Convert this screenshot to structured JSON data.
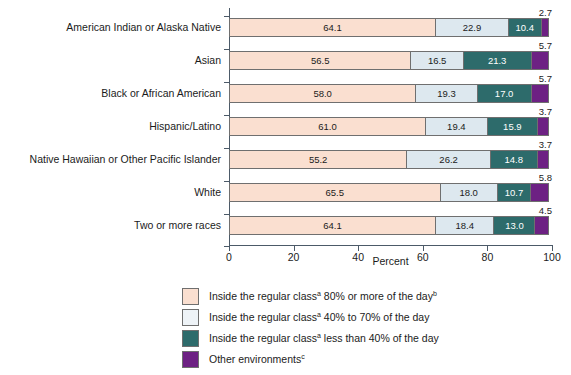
{
  "chart_data": {
    "type": "bar",
    "subtype": "horizontal-stacked",
    "title": "",
    "xlabel": "Percent",
    "ylabel": "",
    "xlim": [
      0,
      100
    ],
    "xticks": [
      0,
      20,
      40,
      60,
      80,
      100
    ],
    "grid": false,
    "legend_position": "bottom",
    "categories": [
      "American Indian or Alaska Native",
      "Asian",
      "Black or African American",
      "Hispanic/Latino",
      "Native Hawaiian or Other Pacific Islander",
      "White",
      "Two or more races"
    ],
    "series": [
      {
        "name": "Inside the regular class 80% or more of the day",
        "color": "#fadfd0",
        "values": [
          64.1,
          56.5,
          58.0,
          61.0,
          55.2,
          65.5,
          64.1
        ]
      },
      {
        "name": "Inside the regular class 40% to 70% of the day",
        "color": "#dde8ef",
        "values": [
          22.9,
          16.5,
          19.3,
          19.4,
          26.2,
          18.0,
          18.4
        ]
      },
      {
        "name": "Inside the regular class less than 40% of the day",
        "color": "#2d6b6b",
        "values": [
          10.4,
          21.3,
          17.0,
          15.9,
          14.8,
          10.7,
          13.0
        ]
      },
      {
        "name": "Other environments",
        "color": "#6d2183",
        "values": [
          2.7,
          5.7,
          5.7,
          3.7,
          3.7,
          5.8,
          4.5
        ]
      }
    ],
    "labels": {
      "s1": [
        "64.1",
        "56.5",
        "58.0",
        "61.0",
        "55.2",
        "65.5",
        "64.1"
      ],
      "s2": [
        "22.9",
        "16.5",
        "19.3",
        "19.4",
        "26.2",
        "18.0",
        "18.4"
      ],
      "s3": [
        "10.4",
        "21.3",
        "17.0",
        "15.9",
        "14.8",
        "10.7",
        "13.0"
      ],
      "s4": [
        "2.7",
        "5.7",
        "5.7",
        "3.7",
        "3.7",
        "5.8",
        "4.5"
      ]
    }
  },
  "axis": {
    "title": "Percent",
    "ticks": [
      "0",
      "20",
      "40",
      "60",
      "80",
      "100"
    ]
  },
  "legend": {
    "items": [
      {
        "swatch": "s1",
        "pre": "Inside the regular class",
        "sup": "a",
        "post": " 80% or more of the day",
        "post_sup": "b"
      },
      {
        "swatch": "s2",
        "pre": "Inside the regular class",
        "sup": "a",
        "post": " 40% to 70% of the day",
        "post_sup": ""
      },
      {
        "swatch": "s3",
        "pre": "Inside the regular class",
        "sup": "a",
        "post": " less than 40% of the day",
        "post_sup": ""
      },
      {
        "swatch": "s4",
        "pre": "Other environments",
        "sup": "",
        "post": "",
        "post_sup": "c"
      }
    ]
  },
  "colors": {
    "series1": "#fadfd0",
    "series2": "#dde8ef",
    "series3": "#2d6b6b",
    "series4": "#6d2183",
    "axis": "#4c5a68",
    "text": "#1b1b1b"
  }
}
